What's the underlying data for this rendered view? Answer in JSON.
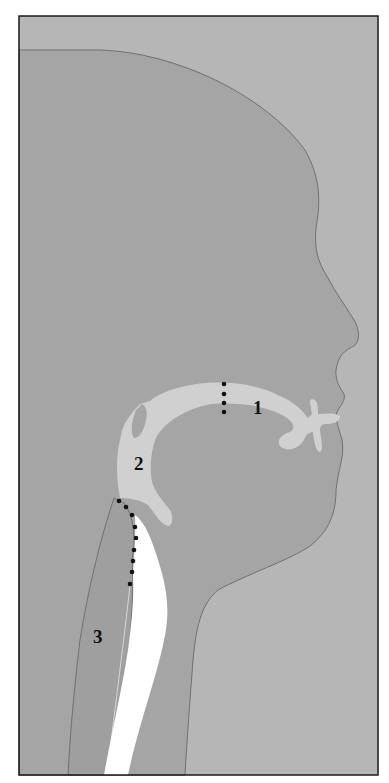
{
  "figure": {
    "type": "anatomical-cross-section",
    "colors": {
      "page": "#ffffff",
      "background": "#b6b6b6",
      "head": "#a5a5a5",
      "airway": "#d0d0d0",
      "trachea_lumen": "#ffffff",
      "outline": "#6e6e6e",
      "frame": "#1a1a1a",
      "markers": "#111111"
    },
    "labels": [
      {
        "id": "1",
        "text": "1",
        "region": "oral cavity",
        "x": 253,
        "y": 414
      },
      {
        "id": "2",
        "text": "2",
        "region": "pharynx",
        "x": 134,
        "y": 470
      },
      {
        "id": "3",
        "text": "3",
        "region": "larynx / trachea",
        "x": 93,
        "y": 643
      }
    ],
    "boundaries": [
      {
        "name": "oral-pharynx-boundary",
        "style": "dotted",
        "points": [
          [
            224,
            384
          ],
          [
            224,
            394
          ],
          [
            224,
            403
          ],
          [
            224,
            412
          ]
        ]
      },
      {
        "name": "pharynx-larynx-boundary",
        "style": "dotted",
        "points": [
          [
            119,
            501
          ],
          [
            126,
            507
          ],
          [
            132,
            515
          ],
          [
            135,
            527
          ],
          [
            136,
            538
          ],
          [
            134,
            550
          ],
          [
            133,
            561
          ],
          [
            132,
            572
          ],
          [
            130,
            584
          ]
        ]
      }
    ]
  }
}
